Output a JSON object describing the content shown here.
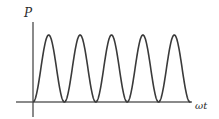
{
  "figure": {
    "width": 219,
    "height": 119,
    "background": "#ffffff"
  },
  "axes": {
    "y_label": "P",
    "x_label": "ωt",
    "axis_color": "#8a8a8a",
    "origin_x": 33,
    "origin_y": 102,
    "y_axis_top": 22,
    "y_axis_bottom": 117,
    "x_axis_left": 16,
    "x_axis_right": 192
  },
  "curve": {
    "color": "#3a3a3a",
    "stroke_width": 1.6,
    "start_x": 33,
    "end_x": 190,
    "peak_y": 35,
    "baseline_y": 102
  },
  "chart_data": {
    "type": "line",
    "title": "",
    "xlabel": "ωt",
    "ylabel": "P",
    "grid": false,
    "legend": null,
    "xlim": [
      0,
      5.0
    ],
    "ylim": [
      0,
      1.0
    ],
    "x_unit": "periods of ωt (one trough-to-trough = π)",
    "function": "P = P_max * sin^2(ωt)",
    "peak_value": 1.0,
    "trough_value": 0.0,
    "period_px": 31.4,
    "num_peaks": 5,
    "num_troughs_on_axis": 5,
    "peaks_x_px": [
      48.7,
      80.1,
      111.5,
      142.9,
      174.3
    ],
    "peaks_y_px": [
      35,
      35,
      35,
      35,
      35
    ],
    "troughs_x_px": [
      33,
      64.4,
      95.8,
      127.2,
      158.6
    ],
    "troughs_y_px": [
      102,
      102,
      102,
      102,
      102
    ],
    "peaks_normalized": [
      {
        "x": 0.5,
        "y": 1.0
      },
      {
        "x": 1.5,
        "y": 1.0
      },
      {
        "x": 2.5,
        "y": 1.0
      },
      {
        "x": 3.5,
        "y": 1.0
      },
      {
        "x": 4.5,
        "y": 1.0
      }
    ],
    "troughs_normalized": [
      {
        "x": 0.0,
        "y": 0.0
      },
      {
        "x": 1.0,
        "y": 0.0
      },
      {
        "x": 2.0,
        "y": 0.0
      },
      {
        "x": 3.0,
        "y": 0.0
      },
      {
        "x": 4.0,
        "y": 0.0
      }
    ],
    "curve_truncated_at": {
      "x": 5.0,
      "y": 0.36
    },
    "series": [
      {
        "name": "P",
        "color": "#3a3a3a",
        "x": [
          0.0,
          0.1,
          0.2,
          0.3,
          0.4,
          0.5,
          0.6,
          0.7,
          0.8,
          0.9,
          1.0,
          1.1,
          1.2,
          1.3,
          1.4,
          1.5,
          1.6,
          1.7,
          1.8,
          1.9,
          2.0,
          2.1,
          2.2,
          2.3,
          2.4,
          2.5,
          2.6,
          2.7,
          2.8,
          2.9,
          3.0,
          3.1,
          3.2,
          3.3,
          3.4,
          3.5,
          3.6,
          3.7,
          3.8,
          3.9,
          4.0,
          4.1,
          4.2,
          4.3,
          4.4,
          4.5,
          4.6,
          4.7,
          4.8,
          4.9,
          5.0
        ],
        "values": [
          0.0,
          0.095,
          0.345,
          0.655,
          0.905,
          1.0,
          0.905,
          0.655,
          0.345,
          0.095,
          0.0,
          0.095,
          0.345,
          0.655,
          0.905,
          1.0,
          0.905,
          0.655,
          0.345,
          0.095,
          0.0,
          0.095,
          0.345,
          0.655,
          0.905,
          1.0,
          0.905,
          0.655,
          0.345,
          0.095,
          0.0,
          0.095,
          0.345,
          0.655,
          0.905,
          1.0,
          0.905,
          0.655,
          0.345,
          0.095,
          0.0,
          0.095,
          0.345,
          0.655,
          0.905,
          1.0,
          0.905,
          0.655,
          0.436,
          0.38,
          0.36
        ]
      }
    ]
  }
}
